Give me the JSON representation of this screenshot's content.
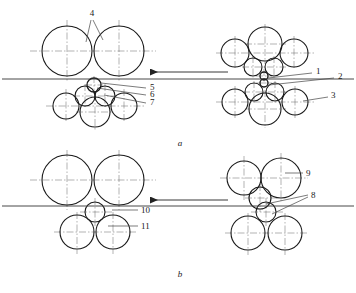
{
  "figure": {
    "type": "engineering-diagram",
    "captions": [
      {
        "id": "panel-a-caption",
        "text": "a",
        "x": 180,
        "y": 146
      },
      {
        "id": "panel-b-caption",
        "text": "b",
        "x": 180,
        "y": 277
      }
    ],
    "callouts": [
      {
        "id": "callout-4",
        "text": "4",
        "x": 92,
        "y": 16
      },
      {
        "id": "callout-5",
        "text": "5",
        "x": 150,
        "y": 90
      },
      {
        "id": "callout-6",
        "text": "6",
        "x": 150,
        "y": 97
      },
      {
        "id": "callout-7",
        "text": "7",
        "x": 150,
        "y": 105
      },
      {
        "id": "callout-1",
        "text": "1",
        "x": 316,
        "y": 74
      },
      {
        "id": "callout-2",
        "text": "2",
        "x": 338,
        "y": 79
      },
      {
        "id": "callout-3",
        "text": "3",
        "x": 331,
        "y": 98
      },
      {
        "id": "callout-9",
        "text": "9",
        "x": 306,
        "y": 175
      },
      {
        "id": "callout-8",
        "text": "8",
        "x": 311,
        "y": 198
      },
      {
        "id": "callout-10",
        "text": "10",
        "x": 141,
        "y": 212
      },
      {
        "id": "callout-11",
        "text": "11",
        "x": 141,
        "y": 228
      }
    ],
    "colors": {
      "outline": "#1a1a1a",
      "centerline": "#555555",
      "passline": "#333333",
      "leader": "#444444",
      "background": "#ffffff"
    },
    "panels": [
      {
        "id": "panel-a",
        "label": "a",
        "passline_y": 78,
        "arrow": {
          "id": "rolling-direction-arrow-a",
          "x1": 228,
          "x2": 148,
          "y": 72,
          "direction": "left"
        },
        "groups": [
          {
            "id": "panel-a-left-exit-stand",
            "rolls": [
              {
                "name": "upper-backup-roll-left",
                "cx": 67,
                "cy": 51,
                "r": 25
              },
              {
                "name": "upper-backup-roll-right",
                "cx": 119,
                "cy": 51,
                "r": 25
              },
              {
                "name": "lower-work-roll-top",
                "cx": 94,
                "cy": 85,
                "r": 7
              },
              {
                "name": "lower-intermediate-left",
                "cx": 85,
                "cy": 96,
                "r": 10
              },
              {
                "name": "lower-intermediate-right",
                "cx": 105,
                "cy": 96,
                "r": 10
              },
              {
                "name": "lower-backup-center",
                "cx": 95,
                "cy": 112,
                "r": 15
              },
              {
                "name": "lower-backup-left",
                "cx": 66,
                "cy": 106,
                "r": 13
              },
              {
                "name": "lower-backup-right",
                "cx": 124,
                "cy": 106,
                "r": 13
              }
            ]
          },
          {
            "id": "panel-a-right-entry-stand",
            "rolls": [
              {
                "name": "upper-backup-center",
                "cx": 265,
                "cy": 44,
                "r": 17
              },
              {
                "name": "upper-backup-left",
                "cx": 235,
                "cy": 53,
                "r": 14
              },
              {
                "name": "upper-backup-right",
                "cx": 294,
                "cy": 53,
                "r": 14
              },
              {
                "name": "upper-intermediate-left",
                "cx": 253,
                "cy": 67,
                "r": 9
              },
              {
                "name": "upper-intermediate-right",
                "cx": 274,
                "cy": 67,
                "r": 9
              },
              {
                "name": "upper-work-roll",
                "cx": 264,
                "cy": 76,
                "r": 4
              },
              {
                "name": "lower-work-roll",
                "cx": 264,
                "cy": 83,
                "r": 4
              },
              {
                "name": "lower-intermediate-left",
                "cx": 254,
                "cy": 92,
                "r": 9
              },
              {
                "name": "lower-intermediate-right",
                "cx": 275,
                "cy": 92,
                "r": 9
              },
              {
                "name": "lower-backup-center",
                "cx": 265,
                "cy": 109,
                "r": 16
              },
              {
                "name": "lower-backup-left",
                "cx": 235,
                "cy": 102,
                "r": 13
              },
              {
                "name": "lower-backup-right",
                "cx": 295,
                "cy": 102,
                "r": 13
              }
            ]
          }
        ]
      },
      {
        "id": "panel-b",
        "label": "b",
        "passline_y": 206,
        "arrow": {
          "id": "rolling-direction-arrow-b",
          "x1": 228,
          "x2": 148,
          "y": 200,
          "direction": "left"
        },
        "groups": [
          {
            "id": "panel-b-left-exit-stand",
            "rolls": [
              {
                "name": "upper-backup-roll-left",
                "cx": 67,
                "cy": 180,
                "r": 25
              },
              {
                "name": "upper-backup-roll-right",
                "cx": 119,
                "cy": 180,
                "r": 25
              },
              {
                "name": "lower-work-roll",
                "cx": 95,
                "cy": 212,
                "r": 10
              },
              {
                "name": "lower-backup-left",
                "cx": 77,
                "cy": 232,
                "r": 17
              },
              {
                "name": "lower-backup-right",
                "cx": 113,
                "cy": 232,
                "r": 17
              }
            ]
          },
          {
            "id": "panel-b-right-entry-stand",
            "rolls": [
              {
                "name": "upper-backup-left",
                "cx": 244,
                "cy": 178,
                "r": 17
              },
              {
                "name": "upper-backup-right",
                "cx": 281,
                "cy": 178,
                "r": 20
              },
              {
                "name": "upper-work-roll",
                "cx": 260,
                "cy": 198,
                "r": 11
              },
              {
                "name": "lower-work-roll",
                "cx": 266,
                "cy": 212,
                "r": 10
              },
              {
                "name": "lower-backup-left",
                "cx": 248,
                "cy": 233,
                "r": 17
              },
              {
                "name": "lower-backup-right",
                "cx": 285,
                "cy": 233,
                "r": 17
              }
            ]
          }
        ]
      }
    ]
  }
}
